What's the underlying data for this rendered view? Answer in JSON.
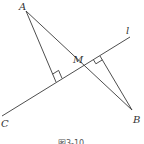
{
  "figure": {
    "caption": "图3-10",
    "line_label": "l",
    "points": {
      "A": {
        "label": "A",
        "x": 26,
        "y": 11
      },
      "B": {
        "label": "B",
        "x": 132,
        "y": 110
      },
      "C": {
        "label": "C",
        "x": 2,
        "y": 116
      },
      "M": {
        "label": "M",
        "x": 80,
        "y": 68
      },
      "L_end": {
        "x": 130,
        "y": 37
      },
      "foot_A": {
        "x": 56,
        "y": 82
      },
      "foot_B": {
        "x": 100,
        "y": 56
      }
    },
    "elements": [
      "line l through C and M",
      "segment AB through M",
      "perpendicular from A to l with right-angle mark",
      "perpendicular from B to l with right-angle mark"
    ],
    "colors": {
      "stroke": "#3a3a3a",
      "background": "#ffffff"
    }
  }
}
